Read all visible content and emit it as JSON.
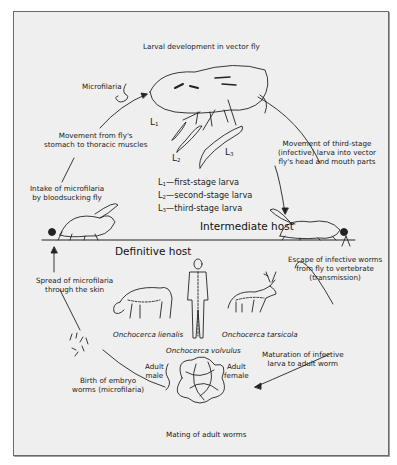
{
  "diagram": {
    "top_label": "Larval development in vector fly",
    "microfilaria_label": "Microfilaria",
    "stages": {
      "L1": "L",
      "L1_sub": "1",
      "L2": "L",
      "L2_sub": "2",
      "L3": "L",
      "L3_sub": "3"
    },
    "legend": [
      {
        "sym": "L",
        "sub": "1",
        "text": "—first-stage larva"
      },
      {
        "sym": "L",
        "sub": "2",
        "text": "—second-stage larva"
      },
      {
        "sym": "L",
        "sub": "3",
        "text": "—third-stage larva"
      }
    ],
    "section_labels": {
      "intermediate": "Intermediate host",
      "definitive": "Definitive host"
    },
    "steps": {
      "movement_stomach_line1": "Movement from fly's",
      "movement_stomach_line2": "stomach to thoracic muscles",
      "movement_third_line1": "Movement of third-stage",
      "movement_third_line2": "(infective) larva into vector",
      "movement_third_line3": "fly's head and mouth parts",
      "intake_line1": "Intake of microfilaria",
      "intake_line2": "by bloodsucking fly",
      "escape_line1": "Escape of infective worms",
      "escape_line2": "from fly to vertebrate",
      "escape_line3": "(transmission)",
      "spread_line1": "Spread of microfilaria",
      "spread_line2": "through the skin",
      "maturation_line1": "Maturation of infective",
      "maturation_line2": "larva to adult worm",
      "birth_line1": "Birth of embryo",
      "birth_line2": "worms (microfilaria)",
      "mating": "Mating of adult worms"
    },
    "hosts": {
      "cattle": "Onchocerca lienalis",
      "human": "Onchocerca volvulus",
      "deer": "Onchocerca tarsicola"
    },
    "worms": {
      "male_line1": "Adult",
      "male_line2": "male",
      "female_line1": "Adult",
      "female_line2": "female"
    },
    "colors": {
      "background": "#efefef",
      "frame": "#6a6a6a",
      "ink": "#1a1a1a"
    }
  }
}
